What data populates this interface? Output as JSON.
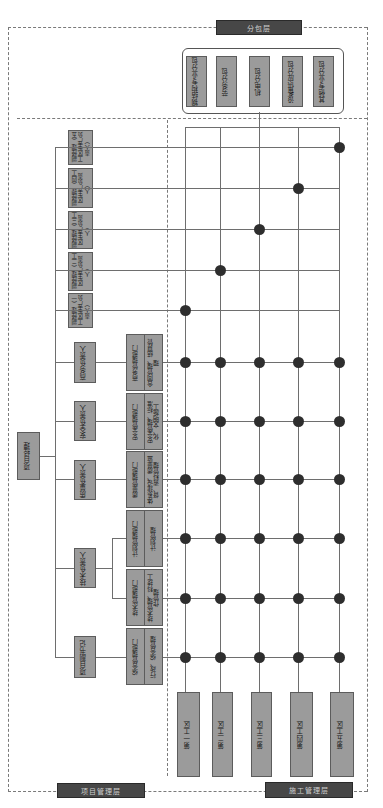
{
  "layers": {
    "subcontract": "分包层",
    "project_management": "项目管理层",
    "construction_management": "施工管理层"
  },
  "subcontractors": [
    {
      "label": "钢结构专业分包"
    },
    {
      "label": "劳务分包"
    },
    {
      "label": "机电分包"
    },
    {
      "label": "设备供应分包"
    },
    {
      "label": "其他专业分包"
    }
  ],
  "project_manager": "项目经理",
  "deputy_managers": [
    {
      "label": "副经理（五工区生产负责人）",
      "zone": 5
    },
    {
      "label": "副经理（四工区生产负责人）",
      "zone": 4
    },
    {
      "label": "副经理（三工区生产负责人）",
      "zone": 3
    },
    {
      "label": "副经理（二工区生产负责人）",
      "zone": 2
    },
    {
      "label": "副经理（一工区生产负责人）",
      "zone": 1
    }
  ],
  "leaders": [
    {
      "label": "商务负责人"
    },
    {
      "label": "安全负责人"
    },
    {
      "label": "质量负责人"
    },
    {
      "label": "技术负责人"
    },
    {
      "label": "项目副书记"
    }
  ],
  "departments": [
    {
      "name": "商务管理部门",
      "duty": "合同管理、结算管理"
    },
    {
      "name": "安全管理部门",
      "duty": "安全管理、标准化、文明施工"
    },
    {
      "name": "质量管理部门",
      "duty": "体系建设、质量监督、资料管理"
    },
    {
      "name": "计划管理部门",
      "duty": "计划管理"
    },
    {
      "name": "技术管理部门",
      "duty": "技术管理、科技工作管理"
    },
    {
      "name": "综合管理部门",
      "duty": "行政、综合管理"
    }
  ],
  "work_zones": [
    {
      "label": "第一工区"
    },
    {
      "label": "第二工区"
    },
    {
      "label": "第三工区"
    },
    {
      "label": "第四工区"
    },
    {
      "label": "第五工区"
    }
  ],
  "colors": {
    "box_fill": "#9b9b9b",
    "header_fill": "#474747",
    "dot": "#2e2e2e",
    "line": "#6e6e6e"
  }
}
